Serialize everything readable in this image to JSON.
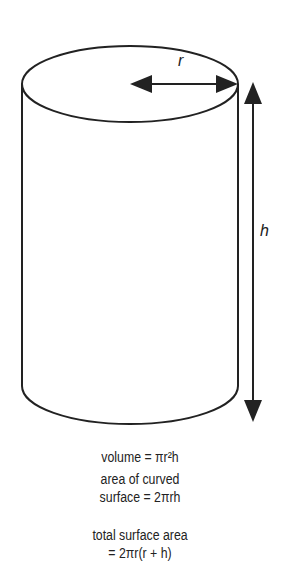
{
  "labels": {
    "radius": "r",
    "height": "h"
  },
  "formulas": {
    "volume": "volume = πr²h",
    "curved_line1": "area of curved",
    "curved_line2": "surface = 2πrh",
    "total_line1": "total surface area",
    "total_line2": "= 2πr(r + h)"
  },
  "colors": {
    "stroke": "#222222"
  }
}
